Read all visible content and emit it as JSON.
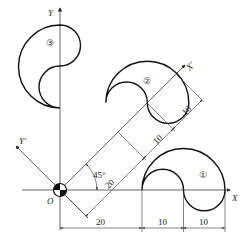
{
  "axes": {
    "x_label": "X",
    "y_label": "Y",
    "x_prime_label": "X'",
    "y_prime_label": "Y'",
    "origin_label": "O"
  },
  "shapes": [
    {
      "id": "shape-1",
      "label": "①"
    },
    {
      "id": "shape-2",
      "label": "②"
    },
    {
      "id": "shape-3",
      "label": "③"
    }
  ],
  "dimensions": {
    "angle": "45°",
    "rotated_offset": "20",
    "rotated_width_1": "10",
    "rotated_width_2": "10",
    "horizontal_offset": "20",
    "horizontal_width_1": "10",
    "horizontal_width_2": "10"
  }
}
